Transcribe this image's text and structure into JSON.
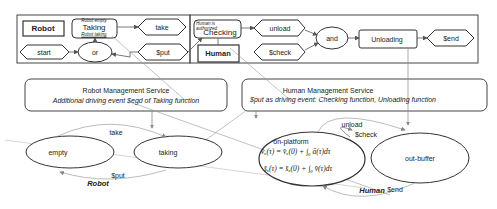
{
  "petri_net": {
    "nodes": {
      "robot": "Robot",
      "taking_top_note": "Robot empty",
      "taking": "Taking",
      "taking_bottom_note": "Robot taking",
      "take": "take",
      "start": "start",
      "or": "or",
      "put": "$put",
      "checking_note": "Human is authorized",
      "checking": "Checking",
      "human": "Human",
      "unload": "unload",
      "check": "$check",
      "and": "and",
      "unloading": "Unloading",
      "end": "$end"
    }
  },
  "services": {
    "robot": {
      "title": "Robot Management Service",
      "subtitle": "Additional driving event $egd of Taking function"
    },
    "human": {
      "title": "Human Management Service",
      "subtitle": "$put as driving event: Checking function, Unloading function"
    }
  },
  "state_machines": {
    "robot": {
      "name": "Robot",
      "states": [
        "empty",
        "taking"
      ],
      "transitions": {
        "take": "take",
        "put": "$put"
      }
    },
    "human": {
      "name": "Human",
      "states": [
        "on-platform",
        "out-buffer"
      ],
      "equation_1": "v̄ₓ(τ) = v̄ₓ(0) + ∫₀ ā(τ)dτ",
      "equation_2": "s̄ₓ(τ) = s̄ₓ(0) + ∫₀ v̄(τ)dτ",
      "transitions": {
        "unload": "unload",
        "check": "$check",
        "end": "$end"
      }
    }
  },
  "colors": {
    "stroke": "#333333",
    "connector": "#9a9a9a",
    "text": "#222222"
  }
}
